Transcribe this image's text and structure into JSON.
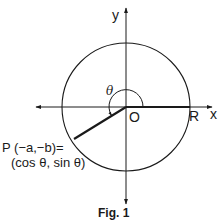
{
  "figure": {
    "caption": "Fig. 1",
    "axes": {
      "x_label": "x",
      "y_label": "y"
    },
    "origin_label": "O",
    "point_r_label": "R",
    "angle_label": "θ",
    "point_p": {
      "line1": "P (−a,−b)=",
      "line2": "(cos θ, sin θ)"
    },
    "colors": {
      "ink": "#1a1a1a",
      "background": "#ffffff"
    }
  }
}
